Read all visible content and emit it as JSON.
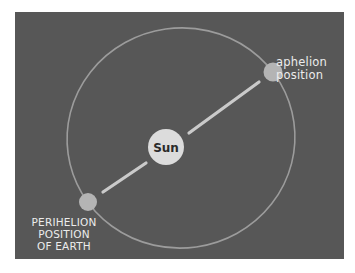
{
  "diagram": {
    "sun": {
      "label": "Sun"
    },
    "aphelion": {
      "label_line1": "aphelion",
      "label_line2": "position"
    },
    "perihelion": {
      "label_line1": "PERIHELION",
      "label_line2": "POSITION",
      "label_line3": "OF EARTH"
    }
  },
  "colors": {
    "background": "#575757",
    "orbit": "#9c9c9c",
    "sun": "#dcdcdc",
    "earth": "#b4b4b4",
    "axis_line": "#cacaca",
    "text": "#ececec"
  }
}
